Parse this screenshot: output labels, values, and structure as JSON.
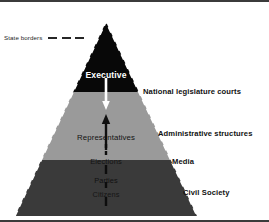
{
  "figure": {
    "background_color": "#ffffff"
  },
  "legend": {
    "label": "State borders",
    "dash_count": 3,
    "dash_color": "#262626",
    "style": "dashed"
  },
  "pyramid": {
    "apex": {
      "x": 106,
      "y": 20
    },
    "base_left": {
      "x": 15,
      "y": 214
    },
    "base_right": {
      "x": 197,
      "y": 214
    },
    "border_color": "#ffffff",
    "border_style": "dashed",
    "bands": [
      {
        "name": "executive-band",
        "fill": "#080808",
        "top_y": 20,
        "bottom_y": 90,
        "label": "Executive",
        "label_color": "#ffffff"
      },
      {
        "name": "administration-band",
        "fill": "#9a9a9a",
        "top_y": 90,
        "bottom_y": 158,
        "label": "Representatives",
        "label_color": "#131313"
      },
      {
        "name": "society-band",
        "fill": "#3a3a3a",
        "top_y": 158,
        "bottom_y": 214,
        "label": "Citizens",
        "label_color": "#151515"
      }
    ]
  },
  "inner_labels": {
    "executive": "Executive",
    "representatives": "Representatives",
    "elections": "Elections",
    "parties": "Parties",
    "citizens": "Citizens"
  },
  "side_labels": {
    "legislature": "National legislature courts",
    "administrative": "Administrative structures",
    "media": "Media",
    "civil_society": "Civil Society"
  },
  "arrows": {
    "downward": {
      "name": "executive-downward-arrow",
      "color": "#ffffff",
      "direction": "down",
      "from_y": 76,
      "to_y": 107
    },
    "upward_solid": {
      "name": "representatives-upward-arrow",
      "color": "#101010",
      "direction": "up",
      "from_y": 148,
      "to_y": 114
    },
    "upward_dashed_mid": {
      "name": "elections-upward-dashed-arrow",
      "color": "#0d0d0d",
      "direction": "up",
      "style": "dashed"
    },
    "upward_dashed_lower": {
      "name": "citizens-upward-dashed-arrow",
      "color": "#0d0d0d",
      "direction": "up",
      "style": "dashed"
    }
  }
}
